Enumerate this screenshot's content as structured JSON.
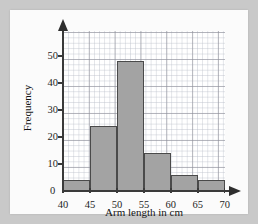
{
  "chart_data": {
    "type": "bar",
    "title": "",
    "xlabel": "Arm length in cm",
    "ylabel": "Frequency",
    "categories": [
      "40-45",
      "45-50",
      "50-55",
      "55-60",
      "60-65",
      "65-70"
    ],
    "bin_edges": [
      40,
      45,
      50,
      55,
      60,
      65,
      70
    ],
    "values": [
      4,
      24,
      48,
      14,
      6,
      4
    ],
    "xlim": [
      40,
      70
    ],
    "ylim": [
      0,
      50
    ],
    "x_ticks": [
      "40",
      "45",
      "50",
      "55",
      "60",
      "65",
      "70"
    ],
    "y_ticks": [
      "0",
      "10",
      "20",
      "30",
      "40",
      "50"
    ],
    "grid": true,
    "grid_minor_divisions": 5,
    "legend": "none",
    "bar_fill_color": "#a3a3a3",
    "bar_border_color": "#4a4a4a",
    "axis_color": "#3a3a3a",
    "panel_color": "#fbfbfb",
    "page_background_color": "#c9c9c9"
  },
  "axes": {
    "origin_label": "0",
    "y_title": "Frequency",
    "x_title": "Arm length in cm"
  }
}
